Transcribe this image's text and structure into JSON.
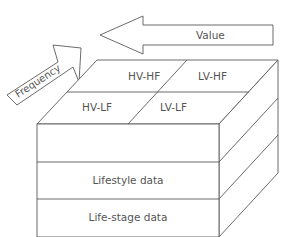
{
  "diagram": {
    "arrows": {
      "value": {
        "label": "Value",
        "direction": "left"
      },
      "frequency": {
        "label": "Frequency",
        "direction": "up-right"
      }
    },
    "top_face": {
      "cells": [
        {
          "label": "HV-HF"
        },
        {
          "label": "LV-HF"
        },
        {
          "label": "HV-LF"
        },
        {
          "label": "LV-LF"
        }
      ]
    },
    "front_face": {
      "layers": [
        {
          "label": ""
        },
        {
          "label": "Lifestyle data"
        },
        {
          "label": "Life-stage data"
        }
      ]
    },
    "colors": {
      "stroke": "#5a5a5a",
      "text": "#555555",
      "background": "#ffffff"
    }
  }
}
